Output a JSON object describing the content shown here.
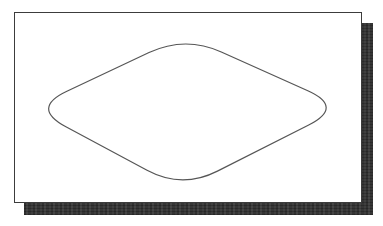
{
  "figure": {
    "background_color": "#ffffff",
    "panel": {
      "x": 14,
      "y": 12,
      "width": 348,
      "height": 191,
      "fill": "#ffffff",
      "border_color": "#3c3c3c",
      "border_width": 1
    },
    "shadow": {
      "offset_x": 10,
      "offset_y": 11,
      "visible_band_thickness": 10,
      "color": "#333333"
    },
    "diamond": {
      "stroke_color": "#565656",
      "stroke_width": 1.2,
      "fill": "none",
      "vertex_top": [
        185,
        35
      ],
      "vertex_right": [
        345,
        107
      ],
      "vertex_bottom": [
        182,
        190
      ],
      "vertex_left": [
        30,
        108
      ],
      "corner_rounding_trim": 40,
      "viewbox": "14 12 348 191",
      "path": "M221.5 51.4 L308.5 90.6 Q345 107 309.4 125.2 L217.6 171.8 Q182 190 146.8 171 L65.2 127 Q30 108 66.2 91 L148.8 52 Q185 35 221.5 51.4 Z"
    }
  }
}
